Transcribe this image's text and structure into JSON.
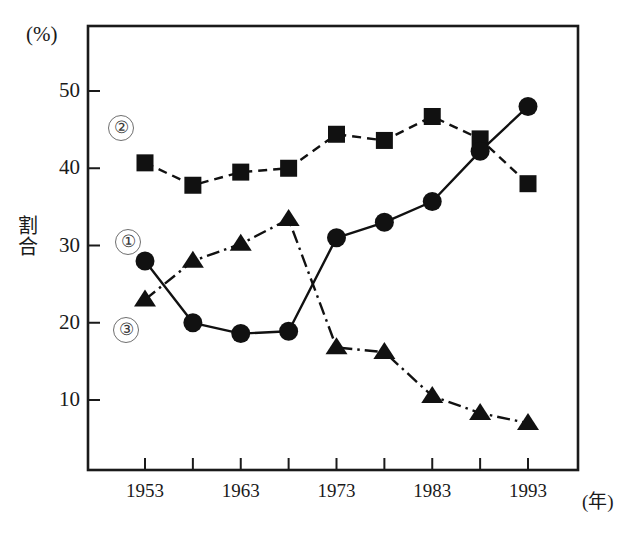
{
  "axes": {
    "y_unit": "(%)",
    "y_title_chars": [
      "割",
      "合"
    ],
    "x_unit": "(年)",
    "y_ticks": [
      "10",
      "20",
      "30",
      "40",
      "50"
    ],
    "x_ticks": [
      "1953",
      "1963",
      "1973",
      "1983",
      "1993"
    ]
  },
  "series_labels": {
    "one": "①",
    "two": "②",
    "three": "③"
  },
  "chart_data": {
    "type": "line",
    "title": "",
    "xlabel": "(年)",
    "ylabel": "割合",
    "y_unit": "(%)",
    "grid": false,
    "legend_position": "inline-annotations",
    "xlim": [
      1951,
      1996
    ],
    "ylim": [
      0,
      55
    ],
    "yticks": [
      10,
      20,
      30,
      40,
      50
    ],
    "xticks": [
      1953,
      1963,
      1973,
      1983,
      1993
    ],
    "x": [
      1953,
      1958,
      1963,
      1968,
      1973,
      1978,
      1983,
      1988,
      1993
    ],
    "series": [
      {
        "name": "②",
        "marker": "square",
        "line_style": "dashed",
        "color": "#111111",
        "values": [
          40.7,
          37.8,
          39.5,
          40.0,
          44.4,
          43.6,
          46.7,
          43.8,
          38.0
        ]
      },
      {
        "name": "①",
        "marker": "triangle",
        "line_style": "dash-dot",
        "color": "#111111",
        "values": [
          23.0,
          28.0,
          30.2,
          33.4,
          16.8,
          16.2,
          10.5,
          8.3,
          7.0
        ]
      },
      {
        "name": "③",
        "marker": "circle",
        "line_style": "solid",
        "color": "#111111",
        "values": [
          28.0,
          20.0,
          18.6,
          18.9,
          31.0,
          33.0,
          35.7,
          42.2,
          48.0
        ]
      }
    ]
  }
}
